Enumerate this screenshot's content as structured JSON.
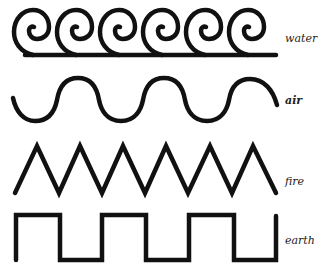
{
  "diagram": {
    "rows": [
      {
        "id": "water",
        "label": "water",
        "shape": "spiral-wave",
        "spirals": 6
      },
      {
        "id": "air",
        "label": "air",
        "shape": "sine-wave",
        "crests": 3
      },
      {
        "id": "fire",
        "label": "fire",
        "shape": "zigzag",
        "peaks": 6
      },
      {
        "id": "earth",
        "label": "earth",
        "shape": "square-wave",
        "plateaus": 3
      }
    ],
    "colors": {
      "stroke": "#111111",
      "background": "#ffffff",
      "label": "#222222"
    }
  }
}
